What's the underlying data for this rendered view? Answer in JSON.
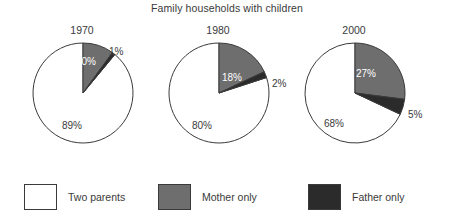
{
  "chart_data": {
    "type": "pie",
    "title": "Family households with children",
    "xlabel": "",
    "ylabel": "",
    "legend_position": "bottom",
    "grid": false,
    "categories": [
      "Two parents",
      "Mother only",
      "Father only"
    ],
    "colors": {
      "two_parents": "#ffffff",
      "mother_only": "#6e6e6e",
      "father_only": "#2b2b2b",
      "outline": "#3a3a3a",
      "text": "#3a3a3a"
    },
    "panels": [
      {
        "year": "1970",
        "values": [
          89,
          10,
          1
        ],
        "labels": [
          "89%",
          "10%",
          "1%"
        ]
      },
      {
        "year": "1980",
        "values": [
          80,
          18,
          2
        ],
        "labels": [
          "80%",
          "18%",
          "2%"
        ]
      },
      {
        "year": "2000",
        "values": [
          68,
          27,
          5
        ],
        "labels": [
          "68%",
          "27%",
          "5%"
        ]
      }
    ]
  },
  "title": "Family households with children",
  "panels": {
    "p1970": {
      "year": "1970",
      "two_parents_label": "89%",
      "mother_only_label": "10%",
      "father_only_label": "1%"
    },
    "p1980": {
      "year": "1980",
      "two_parents_label": "80%",
      "mother_only_label": "18%",
      "father_only_label": "2%"
    },
    "p2000": {
      "year": "2000",
      "two_parents_label": "68%",
      "mother_only_label": "27%",
      "father_only_label": "5%"
    }
  },
  "legend": {
    "items": [
      {
        "label": "Two parents"
      },
      {
        "label": "Mother only"
      },
      {
        "label": "Father only"
      }
    ]
  }
}
